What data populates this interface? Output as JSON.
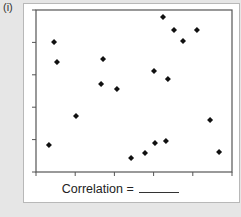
{
  "panel_label": "(i)",
  "caption": {
    "text": "Correlation =",
    "blank": "______"
  },
  "colors": {
    "background": "#e6e6e6",
    "card": "#ffffff",
    "axis": "#555555",
    "point": "#111111"
  },
  "chart_data": {
    "type": "scatter",
    "title": "",
    "xlabel": "",
    "ylabel": "",
    "xlim": [
      0,
      10
    ],
    "ylim": [
      0,
      10
    ],
    "x_ticks": [
      0,
      2,
      4,
      6,
      8,
      10
    ],
    "y_ticks": [
      0,
      2,
      4,
      6,
      8,
      10
    ],
    "tick_labels_shown": false,
    "grid": false,
    "legend": null,
    "annotation": "Correlation = ______",
    "series": [
      {
        "name": "points",
        "marker": "diamond",
        "x": [
          0.66,
          0.92,
          1.07,
          2.04,
          3.32,
          3.42,
          4.13,
          4.85,
          5.56,
          6.02,
          6.07,
          6.48,
          6.63,
          6.73,
          7.04,
          7.5,
          8.21,
          8.88,
          9.34
        ],
        "y": [
          1.67,
          8.02,
          6.79,
          3.46,
          5.43,
          6.98,
          5.12,
          0.86,
          1.17,
          6.23,
          1.79,
          9.57,
          1.91,
          5.74,
          8.77,
          8.09,
          8.77,
          3.21,
          1.23
        ]
      }
    ]
  }
}
